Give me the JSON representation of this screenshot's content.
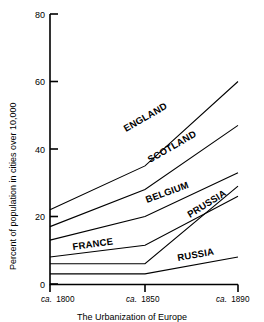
{
  "chart_data": {
    "type": "line",
    "title": "The Urbanization of Europe",
    "xlabel": "",
    "ylabel": "Percent of population in cities over 10,000",
    "x": [
      "ca. 1800",
      "ca. 1850",
      "ca. 1890"
    ],
    "xtick_labels": [
      {
        "prefix": "ca.",
        "year": "1800"
      },
      {
        "prefix": "ca.",
        "year": "1850"
      },
      {
        "prefix": "ca.",
        "year": "1890"
      }
    ],
    "ytick_labels": [
      "0",
      "20",
      "40",
      "60",
      "80"
    ],
    "ytick_values": [
      0,
      20,
      40,
      60,
      80
    ],
    "ylim": [
      0,
      80
    ],
    "grid": false,
    "legend": "inline-labels",
    "series": [
      {
        "name": "ENGLAND",
        "values": [
          22,
          35,
          60
        ]
      },
      {
        "name": "SCOTLAND",
        "values": [
          17,
          28,
          47
        ]
      },
      {
        "name": "BELGIUM",
        "values": [
          13,
          20,
          33
        ]
      },
      {
        "name": "FRANCE",
        "values": [
          8,
          11.5,
          26
        ]
      },
      {
        "name": "PRUSSIA",
        "values": [
          6,
          6,
          29
        ]
      },
      {
        "name": "RUSSIA",
        "values": [
          3,
          3,
          8
        ]
      }
    ],
    "annotations": [
      {
        "text": "ENGLAND",
        "series": "ENGLAND"
      },
      {
        "text": "SCOTLAND",
        "series": "SCOTLAND"
      },
      {
        "text": "BELGIUM",
        "series": "BELGIUM"
      },
      {
        "text": "PRUSSIA",
        "series": "PRUSSIA"
      },
      {
        "text": "FRANCE",
        "series": "FRANCE"
      },
      {
        "text": "RUSSIA",
        "series": "RUSSIA"
      }
    ],
    "colors": {
      "line": "#000000",
      "background": "#ffffff",
      "axis": "#000000"
    }
  }
}
